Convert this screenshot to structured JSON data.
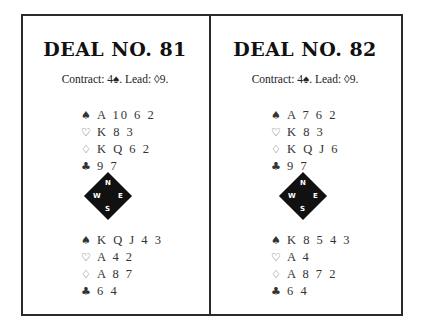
{
  "deals": [
    {
      "title": "DEAL NO. 81",
      "contract_line": "Contract: 4♠. Lead: ◊9.",
      "north": {
        "spades": "A 10 6 2",
        "hearts": "K 8 3",
        "diamonds": "K Q 6 2",
        "clubs": "9 7"
      },
      "south": {
        "spades": "K Q J 4 3",
        "hearts": "A 4 2",
        "diamonds": "A 8 7",
        "clubs": "6 4"
      }
    },
    {
      "title": "DEAL NO. 82",
      "contract_line": "Contract: 4♠. Lead: ◊9.",
      "north": {
        "spades": "A 7 6 2",
        "hearts": "K 8 3",
        "diamonds": "K Q J 6",
        "clubs": "9 7"
      },
      "south": {
        "spades": "K 8 5 4 3",
        "hearts": "A 4",
        "diamonds": "A 8 7 2",
        "clubs": "6 4"
      }
    }
  ],
  "suits": {
    "spades": "♠",
    "hearts": "♡",
    "diamonds": "♢",
    "clubs": "♣"
  },
  "compass": {
    "n": "N",
    "e": "E",
    "s": "S",
    "w": "W"
  }
}
